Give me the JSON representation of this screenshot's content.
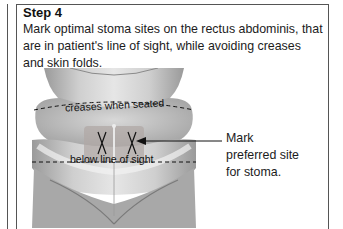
{
  "step": {
    "title": "Step 4",
    "description": "Mark optimal stoma sites on the rectus abdominis, that are in patient's line of sight, while avoiding creases and skin folds."
  },
  "illustration": {
    "subject": "abdomen-illustration",
    "labels": {
      "upper_line": "creases when seated",
      "lower_line": "below line of sight",
      "marks": [
        "X",
        "X"
      ]
    }
  },
  "callout": {
    "lines": [
      "Mark",
      "preferred site",
      "for stoma."
    ]
  },
  "colors": {
    "border": "#555555",
    "text": "#1a1a1a",
    "skin_mid": "#b8b8b8",
    "skin_light": "#e4e4e4"
  }
}
